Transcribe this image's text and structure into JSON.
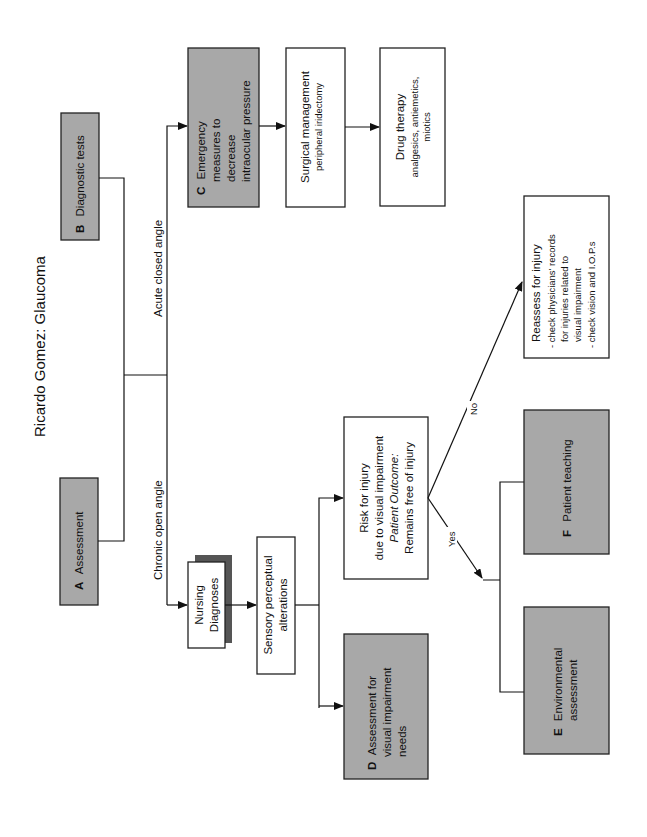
{
  "title": "Ricardo Gomez:  Glaucoma",
  "boxes": {
    "a": {
      "letter": "A",
      "label": "Assessment"
    },
    "b": {
      "letter": "B",
      "label": "Diagnostic tests"
    },
    "c": {
      "letter": "C",
      "lines": [
        "Emergency",
        "measures to",
        "decrease",
        "intraocular pressure"
      ]
    },
    "surgical": {
      "title": "Surgical management",
      "detail": "peripheral iridectomy"
    },
    "drug": {
      "title": "Drug therapy",
      "detail_lines": [
        "analgesics, antiemetics,",
        "miotics"
      ]
    },
    "nursing": {
      "lines": [
        "Nursing",
        "Diagnoses"
      ]
    },
    "sensory": {
      "lines": [
        "Sensory perceptual",
        "alterations"
      ]
    },
    "risk": {
      "lines": [
        "Risk for injury",
        "due to visual impairment"
      ],
      "outcome_label": "Patient Outcome:",
      "outcome": "Remains free of injury"
    },
    "d": {
      "letter": "D",
      "lines": [
        "Assessment for",
        "visual impairment",
        "needs"
      ]
    },
    "reassess": {
      "lines": [
        "Reassess for injury",
        "- check physicians' records",
        "for injuries related to",
        "visual impairment",
        "- check vision and I.O.P.s"
      ]
    },
    "e": {
      "letter": "E",
      "lines": [
        "Environmental",
        "assessment"
      ]
    },
    "f": {
      "letter": "F",
      "label": "Patient teaching"
    }
  },
  "edges": {
    "acute": "Acute closed angle",
    "chronic": "Chronic open angle",
    "yes": "Yes",
    "no": "No"
  },
  "colors": {
    "gray_box": "#a8a8a8",
    "shadow": "#555555",
    "line": "#111111"
  }
}
